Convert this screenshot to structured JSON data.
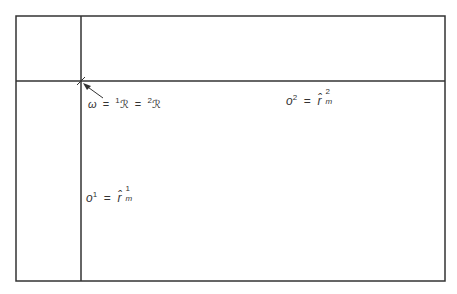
{
  "diagram": {
    "frame": {
      "left": 16,
      "top": 16,
      "right": 445,
      "bottom": 281,
      "stroke": "#333333"
    },
    "vertical_divider_x": 81,
    "horizontal_divider_y": 81,
    "origin_marker": {
      "x": 81,
      "y": 81,
      "arrow_from": {
        "x": 103,
        "y": 97
      }
    },
    "labels": {
      "origin": {
        "lhs": "ω",
        "eq1": "=",
        "sup1": "1",
        "sym1": "ℛ",
        "eq2": "=",
        "sup2": "2",
        "sym2": "ℛ"
      },
      "o2": {
        "base": "o",
        "sup": "2",
        "eq": "=",
        "sym": "r̂",
        "sup_r": "2",
        "sub_r": "m"
      },
      "o1": {
        "base": "o",
        "sup": "1",
        "eq": "=",
        "sym": "r̂",
        "sup_r": "1",
        "sub_r": "m"
      }
    }
  }
}
